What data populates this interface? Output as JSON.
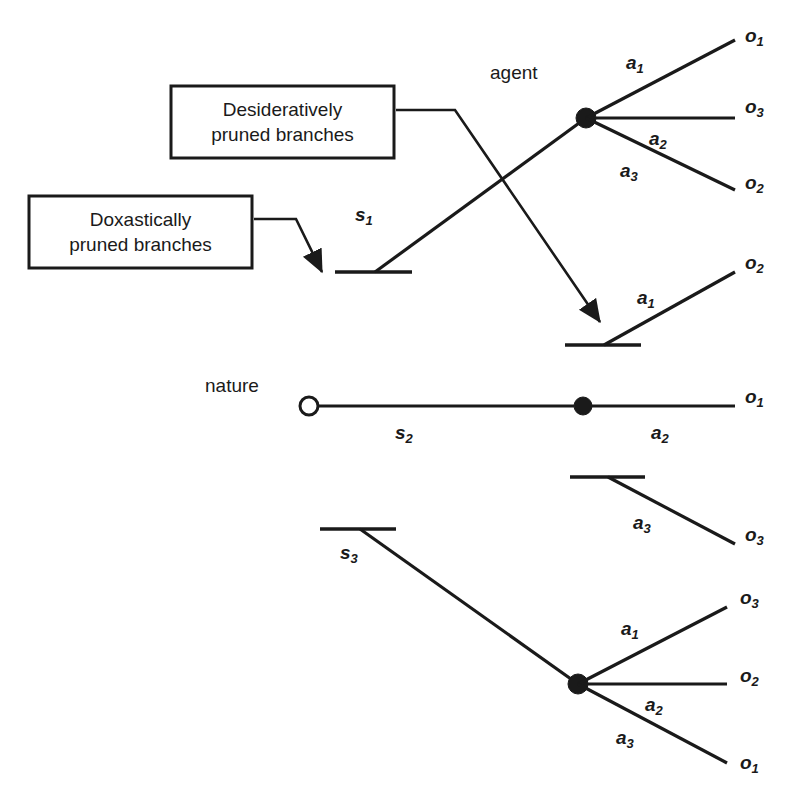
{
  "figure": {
    "kind": "decision-tree-diagram",
    "background_color": "#ffffff",
    "ink_color": "#1a1a1a"
  },
  "callouts": [
    {
      "id": "desiderative",
      "line1": "Desideratively",
      "line2": "pruned branches",
      "text": "Desideratively\npruned branches"
    },
    {
      "id": "doxastic",
      "line1": "Doxastically",
      "line2": "pruned branches",
      "text": "Doxastically\npruned branches"
    }
  ],
  "player_labels": [
    {
      "id": "agent",
      "text": "agent"
    },
    {
      "id": "nature",
      "text": "nature"
    }
  ],
  "state_labels": [
    {
      "id": "s1",
      "base": "s",
      "sub": "1"
    },
    {
      "id": "s2",
      "base": "s",
      "sub": "2"
    },
    {
      "id": "s3",
      "base": "s",
      "sub": "3"
    }
  ],
  "action_labels": [
    {
      "id": "agent-a1",
      "base": "a",
      "sub": "1"
    },
    {
      "id": "agent-a2",
      "base": "a",
      "sub": "2"
    },
    {
      "id": "agent-a3",
      "base": "a",
      "sub": "3"
    },
    {
      "id": "pruned-s1-a1",
      "base": "a",
      "sub": "1"
    },
    {
      "id": "nature-a2",
      "base": "a",
      "sub": "2"
    },
    {
      "id": "pruned-a3",
      "base": "a",
      "sub": "3"
    },
    {
      "id": "bottom-a1",
      "base": "a",
      "sub": "1"
    },
    {
      "id": "bottom-a2",
      "base": "a",
      "sub": "2"
    },
    {
      "id": "bottom-a3",
      "base": "a",
      "sub": "3"
    }
  ],
  "outcome_labels": [
    {
      "id": "agent-o1",
      "base": "o",
      "sub": "1"
    },
    {
      "id": "agent-o3",
      "base": "o",
      "sub": "3"
    },
    {
      "id": "agent-o2",
      "base": "o",
      "sub": "2"
    },
    {
      "id": "pruned-o2",
      "base": "o",
      "sub": "2"
    },
    {
      "id": "nature-o1",
      "base": "o",
      "sub": "1"
    },
    {
      "id": "pruned-o3",
      "base": "o",
      "sub": "3"
    },
    {
      "id": "bottom-o3",
      "base": "o",
      "sub": "3"
    },
    {
      "id": "bottom-o2",
      "base": "o",
      "sub": "2"
    },
    {
      "id": "bottom-o1",
      "base": "o",
      "sub": "1"
    }
  ]
}
